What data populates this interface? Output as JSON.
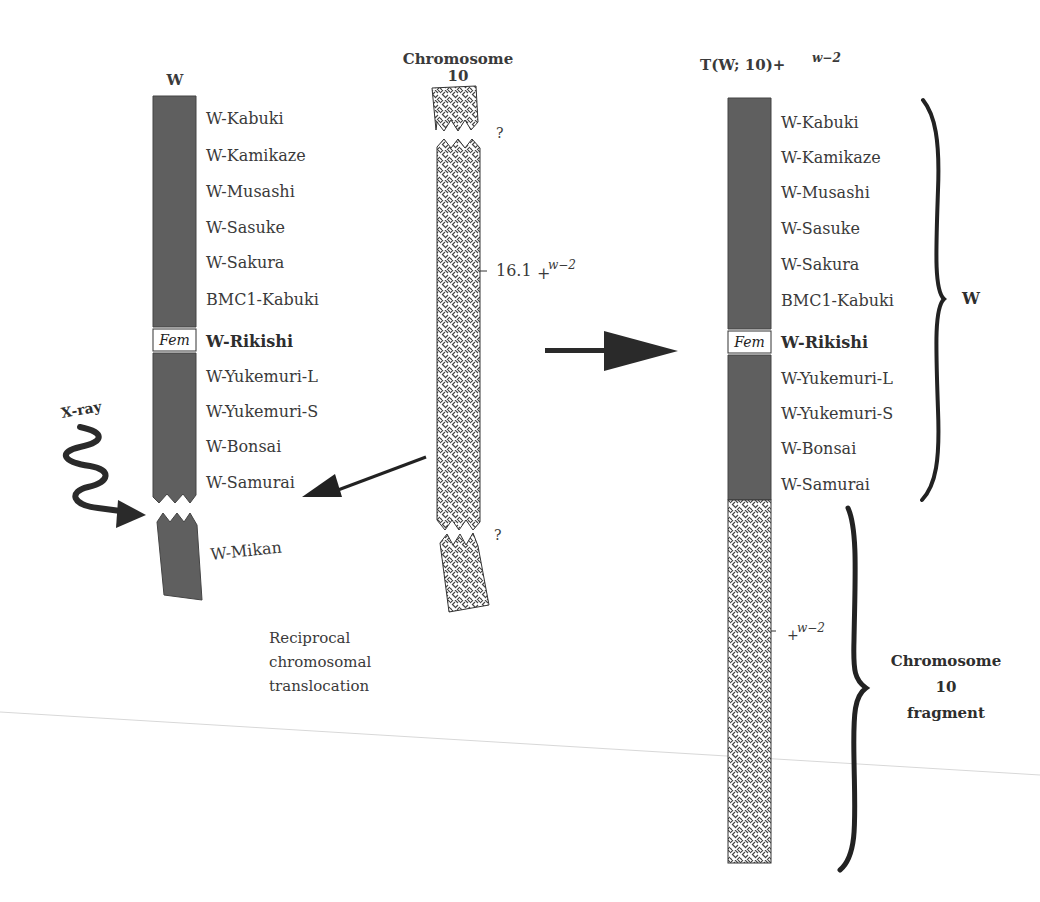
{
  "figure": {
    "colors": {
      "w_chromosome": "#5f5f5f",
      "pattern_bg": "#ffffff",
      "pattern_line": "#444444",
      "text": "#3a3a3a",
      "arrow": "#222222"
    },
    "left_chromosome": {
      "title": "W",
      "loci": [
        "W-Kabuki",
        "W-Kamikaze",
        "W-Musashi",
        "W-Sasuke",
        "W-Sakura",
        "BMC1-Kabuki",
        "W-Rikishi",
        "W-Yukemuri-L",
        "W-Yukemuri-S",
        "W-Bonsai",
        "W-Samurai"
      ],
      "fem_label": "Fem",
      "bold_locus": "W-Rikishi",
      "broken_fragment_locus": "W-Mikan",
      "xray_label": "X-ray"
    },
    "middle_chromosome": {
      "title_line1": "Chromosome",
      "title_line2": "10",
      "question_top": "?",
      "question_bottom": "?",
      "marker_value": "16.1",
      "marker_plus": "+",
      "marker_sup": "w−2"
    },
    "caption": {
      "line1": "Reciprocal",
      "line2": "chromosomal",
      "line3": "translocation"
    },
    "right_chromosome": {
      "title_main": "T(W; 10)+",
      "title_sup": "w−2",
      "loci": [
        "W-Kabuki",
        "W-Kamikaze",
        "W-Musashi",
        "W-Sasuke",
        "W-Sakura",
        "BMC1-Kabuki",
        "W-Rikishi",
        "W-Yukemuri-L",
        "W-Yukemuri-S",
        "W-Bonsai",
        "W-Samurai"
      ],
      "fem_label": "Fem",
      "w_brace_label": "W",
      "fragment_marker_plus": "+",
      "fragment_marker_sup": "w−2",
      "fragment_label_line1": "Chromosome",
      "fragment_label_line2": "10",
      "fragment_label_line3": "fragment"
    }
  }
}
